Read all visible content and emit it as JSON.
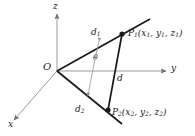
{
  "figure": {
    "colors": {
      "axis": "#9a9a9a",
      "vector": "#1a1a1a",
      "arc": "#a0a0a0",
      "text": "#1a1a1a",
      "background": "#ffffff"
    },
    "axes": [
      {
        "name": "z-axis",
        "label": "z",
        "direction": "up"
      },
      {
        "name": "y-axis",
        "label": "y",
        "direction": "right"
      },
      {
        "name": "x-axis",
        "label": "x",
        "direction": "down-left"
      }
    ],
    "origin": {
      "label": "O"
    },
    "segments": [
      {
        "name": "d1",
        "label": "d",
        "sub": "1"
      },
      {
        "name": "d2",
        "label": "d",
        "sub": "2"
      },
      {
        "name": "d",
        "label": "d",
        "sub": ""
      }
    ],
    "angle": {
      "label": "θ"
    },
    "points": [
      {
        "name": "P1",
        "label": "P",
        "sub": "1",
        "open": "(",
        "coords": [
          {
            "sym": "x",
            "sub": "1",
            "sep": ", "
          },
          {
            "sym": "y",
            "sub": "1",
            "sep": ", "
          },
          {
            "sym": "z",
            "sub": "1",
            "sep": ""
          }
        ],
        "close": ")"
      },
      {
        "name": "P2",
        "label": "P",
        "sub": "2",
        "open": "(",
        "coords": [
          {
            "sym": "x",
            "sub": "2",
            "sep": ", "
          },
          {
            "sym": "y",
            "sub": "2",
            "sep": ", "
          },
          {
            "sym": "z",
            "sub": "2",
            "sep": ""
          }
        ],
        "close": ")"
      }
    ]
  }
}
